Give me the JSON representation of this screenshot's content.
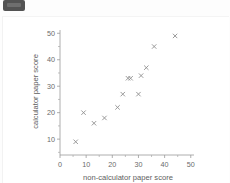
{
  "window": {
    "background_color": "#fdfdfd",
    "chip_color": "#535353"
  },
  "chart_data": {
    "type": "scatter",
    "title": "",
    "xlabel": "non-calculator paper score",
    "ylabel": "calculator paper score",
    "xlim": [
      0,
      52
    ],
    "ylim": [
      4,
      52
    ],
    "xticks": [
      0,
      10,
      20,
      30,
      40,
      50
    ],
    "yticks": [
      10,
      20,
      30,
      40,
      50
    ],
    "xtick_labels": [
      "0",
      "10",
      "20",
      "30",
      "40",
      "50"
    ],
    "ytick_labels": [
      "10",
      "20",
      "30",
      "40",
      "50"
    ],
    "grid": false,
    "legend": null,
    "marker": "x",
    "marker_color": "#8e8e8e",
    "n_points": 13,
    "x": [
      6,
      9,
      13,
      17,
      22,
      24,
      26,
      27,
      30,
      31,
      33,
      36,
      44
    ],
    "y": [
      9,
      20,
      16,
      18,
      22,
      27,
      33,
      33,
      27,
      34,
      37,
      45,
      49
    ],
    "points": [
      {
        "x": 6,
        "y": 9
      },
      {
        "x": 9,
        "y": 20
      },
      {
        "x": 13,
        "y": 16
      },
      {
        "x": 17,
        "y": 18
      },
      {
        "x": 22,
        "y": 22
      },
      {
        "x": 24,
        "y": 27
      },
      {
        "x": 26,
        "y": 33
      },
      {
        "x": 27,
        "y": 33
      },
      {
        "x": 30,
        "y": 27
      },
      {
        "x": 31,
        "y": 34
      },
      {
        "x": 33,
        "y": 37
      },
      {
        "x": 36,
        "y": 45
      },
      {
        "x": 44,
        "y": 49
      }
    ]
  }
}
